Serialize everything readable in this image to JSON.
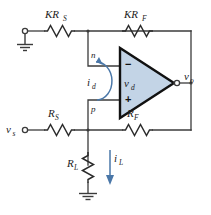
{
  "figure": {
    "kind": "op-amp-circuit-schematic",
    "background_color": "#ffffff",
    "wire_color": "#3b3b3b",
    "opamp_fill_color": "#c3d4e6",
    "opamp_border_color": "#111111",
    "current_arrow_color": "#4a77a8"
  },
  "components": {
    "r_top_left": {
      "label": "KR",
      "sub": "S"
    },
    "r_top_right": {
      "label": "KR",
      "sub": "F"
    },
    "r_bottom_left": {
      "label": "R",
      "sub": "S"
    },
    "r_bottom_right": {
      "label": "R",
      "sub": "F"
    },
    "r_load": {
      "label": "R",
      "sub": "L"
    }
  },
  "terminals": {
    "source": {
      "label": "v",
      "sub": "s"
    },
    "output": {
      "label": "v",
      "sub": "o"
    }
  },
  "nodes": {
    "inverting": "n",
    "noninverting": "p"
  },
  "opamp": {
    "differential_voltage": {
      "label": "v",
      "sub": "d"
    },
    "minus_sign": "−",
    "plus_sign": "+"
  },
  "currents": {
    "differential": {
      "label": "i",
      "sub": "d"
    },
    "load": {
      "label": "i",
      "sub": "L"
    }
  }
}
